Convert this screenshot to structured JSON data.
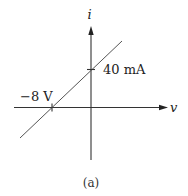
{
  "diagram": {
    "type": "i-v characteristic (linear)",
    "axes": {
      "x_label": "v",
      "y_label": "i"
    },
    "intercepts": {
      "current_label": "40 mA",
      "voltage_label": "−8 V"
    },
    "caption": "(a)",
    "colors": {
      "axis": "#333333",
      "line": "#555555",
      "text": "#222222",
      "background": "#ffffff"
    }
  }
}
